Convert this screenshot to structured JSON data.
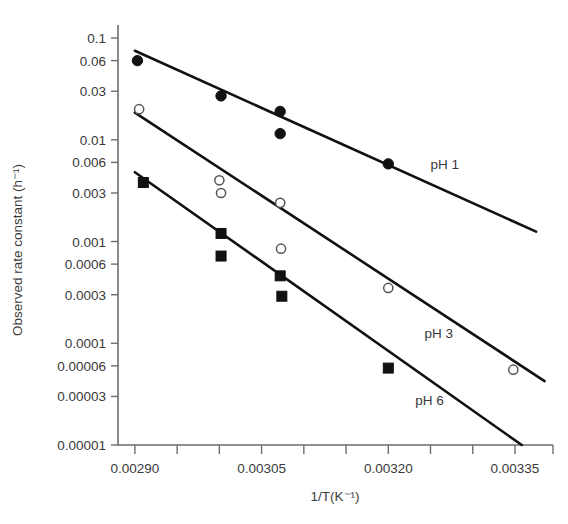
{
  "chart_data": {
    "type": "scatter",
    "title": "",
    "xlabel": "1/T(K⁻¹)",
    "ylabel": "Observed rate constant (h⁻¹)",
    "yscale": "log",
    "xlim": [
      0.00288,
      0.003395
    ],
    "ylim": [
      1e-05,
      0.12
    ],
    "grid": false,
    "legend_position": "inline-right",
    "xticks": [
      {
        "value": 0.0029,
        "label": "0.00290",
        "major": true
      },
      {
        "value": 0.00295,
        "label": "",
        "major": false
      },
      {
        "value": 0.003,
        "label": "",
        "major": false
      },
      {
        "value": 0.00305,
        "label": "0.00305",
        "major": true
      },
      {
        "value": 0.0031,
        "label": "",
        "major": false
      },
      {
        "value": 0.00315,
        "label": "",
        "major": false
      },
      {
        "value": 0.0032,
        "label": "0.00320",
        "major": true
      },
      {
        "value": 0.00325,
        "label": "",
        "major": false
      },
      {
        "value": 0.0033,
        "label": "",
        "major": false
      },
      {
        "value": 0.00335,
        "label": "0.00335",
        "major": true
      }
    ],
    "yticks": [
      {
        "value": 0.1,
        "label": "0.1"
      },
      {
        "value": 0.06,
        "label": "0.06"
      },
      {
        "value": 0.03,
        "label": "0.03"
      },
      {
        "value": 0.01,
        "label": "0.01"
      },
      {
        "value": 0.006,
        "label": "0.006"
      },
      {
        "value": 0.003,
        "label": "0.003"
      },
      {
        "value": 0.001,
        "label": "0.001"
      },
      {
        "value": 0.0006,
        "label": "0.0006"
      },
      {
        "value": 0.0003,
        "label": "0.0003"
      },
      {
        "value": 0.0001,
        "label": "0.0001"
      },
      {
        "value": 6e-05,
        "label": "0.00006"
      },
      {
        "value": 3e-05,
        "label": "0.00003"
      },
      {
        "value": 1e-05,
        "label": "0.00001"
      }
    ],
    "series": [
      {
        "name": "pH 1",
        "marker": "filled-circle",
        "label_x": 0.00325,
        "label_y": 0.0052,
        "fit_line": {
          "x": [
            0.0029,
            0.003375
          ],
          "y": [
            0.075,
            0.00125
          ]
        },
        "points": [
          {
            "x": 0.002903,
            "y": 0.06
          },
          {
            "x": 0.003002,
            "y": 0.027
          },
          {
            "x": 0.003072,
            "y": 0.019
          },
          {
            "x": 0.003072,
            "y": 0.0115
          },
          {
            "x": 0.0032,
            "y": 0.0058
          }
        ]
      },
      {
        "name": "pH 3",
        "marker": "open-circle",
        "label_x": 0.003243,
        "label_y": 0.000112,
        "fit_line": {
          "x": [
            0.0029,
            0.003385
          ],
          "y": [
            0.0185,
            4.25e-05
          ]
        },
        "points": [
          {
            "x": 0.002905,
            "y": 0.02
          },
          {
            "x": 0.003,
            "y": 0.004
          },
          {
            "x": 0.003002,
            "y": 0.003
          },
          {
            "x": 0.003072,
            "y": 0.0024
          },
          {
            "x": 0.003073,
            "y": 0.00085
          },
          {
            "x": 0.0032,
            "y": 0.00035
          },
          {
            "x": 0.003348,
            "y": 5.5e-05
          }
        ]
      },
      {
        "name": "pH 6",
        "marker": "filled-square",
        "label_x": 0.003232,
        "label_y": 2.46e-05,
        "fit_line": {
          "x": [
            0.0029,
            0.003358
          ],
          "y": [
            0.0048,
            1e-05
          ]
        },
        "points": [
          {
            "x": 0.00291,
            "y": 0.0038
          },
          {
            "x": 0.003002,
            "y": 0.0012
          },
          {
            "x": 0.003002,
            "y": 0.00072
          },
          {
            "x": 0.003072,
            "y": 0.00046
          },
          {
            "x": 0.003074,
            "y": 0.00029
          },
          {
            "x": 0.0032,
            "y": 5.7e-05
          }
        ]
      }
    ]
  }
}
